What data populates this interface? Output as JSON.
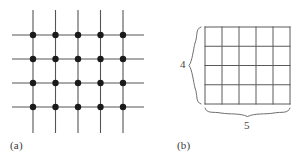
{
  "figure": {
    "background_color": "#ffffff",
    "line_color": "#555555",
    "dot_color": "#1a1a1a",
    "brace_color": "#6b6b6b",
    "text_color": "#3a3a3a"
  },
  "panels": [
    {
      "id": "a",
      "caption": "(a)",
      "type": "lattice-of-points-on-grid",
      "columns": 5,
      "rows": 4,
      "dot_count": 20,
      "dot_radius": 3.2,
      "grid": {
        "x_positions": [
          33,
          55.5,
          78,
          100.5,
          123
        ],
        "y_positions": [
          35,
          59,
          83,
          107
        ],
        "horizontal_line_x_start": 12,
        "horizontal_line_x_end": 144,
        "vertical_line_y_start": 10,
        "vertical_line_y_end": 133
      }
    },
    {
      "id": "b",
      "caption": "(b)",
      "type": "rectangular-grid-with-dimension-braces",
      "columns": 5,
      "rows": 4,
      "cell_count": 20,
      "height_label": "4",
      "width_label": "5",
      "grid": {
        "left": 52,
        "right": 137,
        "top": 27,
        "bottom": 104,
        "x_positions": [
          52,
          69,
          86,
          103,
          120,
          137
        ],
        "y_positions": [
          27,
          46.25,
          65.5,
          84.75,
          104
        ]
      },
      "braces": {
        "left_brace": {
          "x": 40,
          "y_top": 27,
          "y_bottom": 104
        },
        "bottom_brace": {
          "y": 112,
          "x_left": 52,
          "x_right": 137
        }
      }
    }
  ]
}
